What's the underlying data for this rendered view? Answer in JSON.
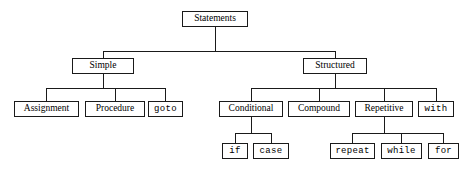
{
  "diagram": {
    "line_color": "#1a1a1a",
    "box_border_color": "#1a1a1a",
    "box_fill_color": "#ffffff",
    "background_color": "#ffffff",
    "nodes": {
      "statements": {
        "label": "Statements",
        "style": "serif",
        "x": 182,
        "y": 11,
        "w": 66,
        "h": 16
      },
      "simple": {
        "label": "Simple",
        "style": "serif",
        "x": 72,
        "y": 58,
        "w": 62,
        "h": 16
      },
      "structured": {
        "label": "Structured",
        "style": "serif",
        "x": 303,
        "y": 58,
        "w": 64,
        "h": 16
      },
      "assignment": {
        "label": "Assignment",
        "style": "serif",
        "x": 14,
        "y": 101,
        "w": 65,
        "h": 16
      },
      "procedure": {
        "label": "Procedure",
        "style": "serif",
        "x": 85,
        "y": 101,
        "w": 60,
        "h": 16
      },
      "goto": {
        "label": "goto",
        "style": "mono",
        "x": 148,
        "y": 101,
        "w": 35,
        "h": 16
      },
      "conditional": {
        "label": "Conditional",
        "style": "serif",
        "x": 219,
        "y": 101,
        "w": 64,
        "h": 16
      },
      "compound": {
        "label": "Compound",
        "style": "serif",
        "x": 288,
        "y": 101,
        "w": 62,
        "h": 16
      },
      "repetitive": {
        "label": "Repetitive",
        "style": "serif",
        "x": 355,
        "y": 101,
        "w": 58,
        "h": 16
      },
      "with": {
        "label": "with",
        "style": "mono",
        "x": 418,
        "y": 101,
        "w": 36,
        "h": 16
      },
      "if": {
        "label": "if",
        "style": "mono",
        "x": 222,
        "y": 143,
        "w": 26,
        "h": 16
      },
      "case": {
        "label": "case",
        "style": "mono",
        "x": 253,
        "y": 143,
        "w": 36,
        "h": 16
      },
      "repeat": {
        "label": "repeat",
        "style": "mono",
        "x": 330,
        "y": 143,
        "w": 45,
        "h": 16
      },
      "while": {
        "label": "while",
        "style": "mono",
        "x": 381,
        "y": 143,
        "w": 41,
        "h": 16
      },
      "for": {
        "label": "for",
        "style": "mono",
        "x": 428,
        "y": 143,
        "w": 31,
        "h": 16
      }
    },
    "edges": [
      {
        "from": "statements",
        "to": "simple"
      },
      {
        "from": "statements",
        "to": "structured"
      },
      {
        "from": "simple",
        "to": "assignment"
      },
      {
        "from": "simple",
        "to": "procedure"
      },
      {
        "from": "simple",
        "to": "goto"
      },
      {
        "from": "structured",
        "to": "conditional"
      },
      {
        "from": "structured",
        "to": "compound"
      },
      {
        "from": "structured",
        "to": "repetitive"
      },
      {
        "from": "structured",
        "to": "with"
      },
      {
        "from": "conditional",
        "to": "if"
      },
      {
        "from": "conditional",
        "to": "case"
      },
      {
        "from": "repetitive",
        "to": "repeat"
      },
      {
        "from": "repetitive",
        "to": "while"
      },
      {
        "from": "repetitive",
        "to": "for"
      }
    ],
    "buses": [
      {
        "name": "statements-bus",
        "y": 51,
        "x1": 103,
        "x2": 335
      },
      {
        "name": "simple-bus",
        "y": 88,
        "x1": 46,
        "x2": 165
      },
      {
        "name": "structured-bus",
        "y": 88,
        "x1": 251,
        "x2": 436
      },
      {
        "name": "conditional-bus",
        "y": 133,
        "x1": 235,
        "x2": 271
      },
      {
        "name": "repetitive-bus",
        "y": 133,
        "x1": 352,
        "x2": 443
      }
    ]
  }
}
